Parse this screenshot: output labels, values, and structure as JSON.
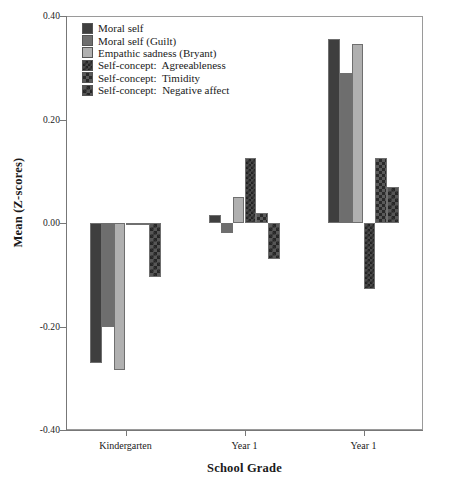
{
  "chart_data": {
    "type": "bar",
    "title": "",
    "xlabel": "School Grade",
    "ylabel": "Mean (Z-scores)",
    "categories": [
      "Kindergarten",
      "Year 1",
      "Year 1"
    ],
    "ylim": [
      -0.4,
      0.4
    ],
    "yticks": [
      "0.40",
      "0.20",
      "0.00",
      "-0.20",
      "-0.40"
    ],
    "ytick_values": [
      0.4,
      0.2,
      0.0,
      -0.2,
      -0.4
    ],
    "grid": false,
    "legend_position": "top-left",
    "series": [
      {
        "name": "Moral self",
        "fill": "f-dark",
        "color": "#3f3f3f",
        "values": [
          -0.27,
          0.015,
          0.355
        ]
      },
      {
        "name": "Moral self (Guilt)",
        "fill": "f-mid",
        "color": "#6e6e6e",
        "values": [
          -0.2,
          -0.02,
          0.29
        ]
      },
      {
        "name": "Empathic sadness (Bryant)",
        "fill": "f-light",
        "color": "#b0b0b0",
        "values": [
          -0.285,
          0.05,
          0.345
        ]
      },
      {
        "name": "Self-concept:  Agreeableness",
        "fill": "f-check1",
        "color": "#4a4a4a",
        "values": [
          0.0,
          0.125,
          -0.128
        ]
      },
      {
        "name": "Self-concept:  Timidity",
        "fill": "f-check2",
        "color": "#5a5a5a",
        "values": [
          0.0,
          0.02,
          0.125
        ]
      },
      {
        "name": "Self-concept:  Negative affect",
        "fill": "f-check3",
        "color": "#565656",
        "values": [
          -0.105,
          -0.07,
          0.07
        ]
      }
    ]
  }
}
